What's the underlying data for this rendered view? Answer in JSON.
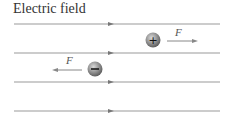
{
  "title": "Electric field",
  "field_lines": [
    24,
    53,
    82,
    111
  ],
  "charges": [
    {
      "sign": "+",
      "force_label": "F",
      "direction": "right"
    },
    {
      "sign": "−",
      "force_label": "F",
      "direction": "left"
    }
  ],
  "colors": {
    "line": "#888888",
    "charge": "#777777"
  }
}
